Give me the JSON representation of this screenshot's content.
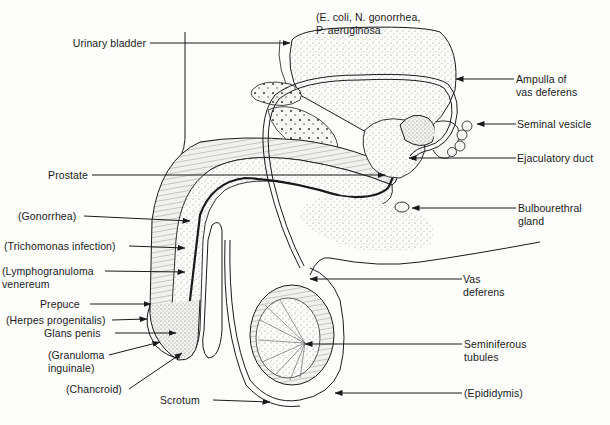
{
  "diagram": {
    "labels_left": [
      {
        "id": "urinary-bladder",
        "lines": [
          "Urinary bladder"
        ]
      },
      {
        "id": "prostate",
        "lines": [
          "Prostate"
        ]
      },
      {
        "id": "gonorrhea",
        "lines": [
          "(Gonorrhea)"
        ]
      },
      {
        "id": "trichomonas",
        "lines": [
          "(Trichomonas infection)"
        ]
      },
      {
        "id": "lymphogranuloma",
        "lines": [
          "(Lymphogranuloma",
          "venereum"
        ]
      },
      {
        "id": "prepuce",
        "lines": [
          "Prepuce"
        ]
      },
      {
        "id": "herpes",
        "lines": [
          "(Herpes progenitalis)"
        ]
      },
      {
        "id": "glans-penis",
        "lines": [
          "Glans penis"
        ]
      },
      {
        "id": "granuloma",
        "lines": [
          "(Granuloma",
          "inguinale)"
        ]
      },
      {
        "id": "chancroid",
        "lines": [
          "(Chancroid)"
        ]
      },
      {
        "id": "scrotum",
        "lines": [
          "Scrotum"
        ]
      }
    ],
    "labels_right": [
      {
        "id": "bladder-pathogens",
        "lines": [
          "(E. coli, N. gonorrhea,",
          "P. aeruginosa"
        ]
      },
      {
        "id": "ampulla",
        "lines": [
          "Ampulla of",
          "vas deferens"
        ]
      },
      {
        "id": "seminal-vesicle",
        "lines": [
          "Seminal vesicle"
        ]
      },
      {
        "id": "ejaculatory-duct",
        "lines": [
          "Ejaculatory duct"
        ]
      },
      {
        "id": "bulbourethral",
        "lines": [
          "Bulbourethral",
          "gland"
        ]
      },
      {
        "id": "vas-deferens",
        "lines": [
          "Vas",
          "deferens"
        ]
      },
      {
        "id": "seminiferous",
        "lines": [
          "Seminiferous",
          "tubules"
        ]
      },
      {
        "id": "epididymis",
        "lines": [
          "(Epididymis)"
        ]
      }
    ]
  },
  "colors": {
    "ink": "#1a1a1a",
    "stipple": "#9a9a9a",
    "background": "#fdfdfc"
  }
}
